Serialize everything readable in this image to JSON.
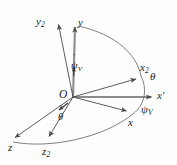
{
  "figure": {
    "background_color": "#fdfdfd",
    "line_color": "#4a4a4a",
    "text_color": "#1b1b1b",
    "width": 177,
    "height": 165
  },
  "origin": {
    "label": "O",
    "x": 73,
    "y": 97
  },
  "axes": [
    {
      "id": "y",
      "label": "y",
      "subscript": "",
      "prime": false,
      "tip_x": 75,
      "tip_y": 24,
      "label_x": 78,
      "label_y": 17
    },
    {
      "id": "y2",
      "label": "y",
      "subscript": "2",
      "prime": false,
      "tip_x": 57,
      "tip_y": 22,
      "label_x": 36,
      "label_y": 16
    },
    {
      "id": "x-prime",
      "label": "x",
      "subscript": "",
      "prime": true,
      "tip_x": 155,
      "tip_y": 97,
      "label_x": 157,
      "label_y": 91
    },
    {
      "id": "x2",
      "label": "x",
      "subscript": "2",
      "prime": false,
      "tip_x": 139,
      "tip_y": 77,
      "label_x": 140,
      "label_y": 62
    },
    {
      "id": "x",
      "label": "x",
      "subscript": "",
      "prime": false,
      "tip_x": 130,
      "tip_y": 113,
      "label_x": 128,
      "label_y": 117
    },
    {
      "id": "z",
      "label": "z",
      "subscript": "",
      "prime": false,
      "tip_x": 12,
      "tip_y": 140,
      "label_x": 10,
      "label_y": 143
    },
    {
      "id": "z2",
      "label": "z",
      "subscript": "2",
      "prime": false,
      "tip_x": 48,
      "tip_y": 140,
      "label_x": 43,
      "label_y": 146
    }
  ],
  "angles": [
    {
      "id": "theta",
      "symbol": "θ",
      "subscript": "",
      "label_x": 150,
      "label_y": 72
    },
    {
      "id": "psi-v",
      "symbol": "ψ",
      "subscript": "V",
      "label_x": 142,
      "label_y": 105
    }
  ],
  "rates": [
    {
      "id": "psi-v-dot",
      "symbol": "ψ",
      "subscript": "V",
      "dot": "˙",
      "label_x": 73,
      "label_y": 62,
      "arrow_tip_x": 74,
      "arrow_tip_y": 64
    },
    {
      "id": "theta-dot",
      "symbol": "θ",
      "subscript": "",
      "dot": "˙",
      "label_x": 60,
      "label_y": 114,
      "arrow_tip_x": 57,
      "arrow_tip_y": 112
    }
  ],
  "arcs": [
    {
      "id": "arc-y-to-x2",
      "description": "great-circle arc from y axis tip curving down to x2 axis tip"
    },
    {
      "id": "arc-x2-to-x",
      "description": "short arc from x2 down past x-prime toward x"
    },
    {
      "id": "arc-z-to-x",
      "description": "long arc from z through z2 sweeping right toward x"
    }
  ]
}
